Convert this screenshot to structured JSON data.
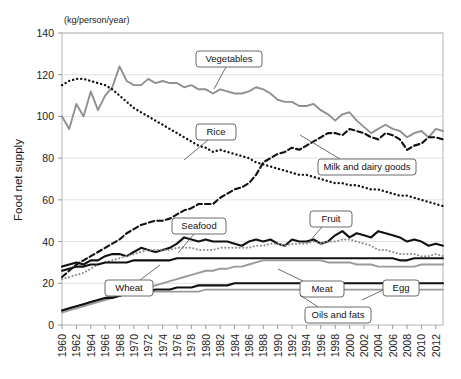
{
  "chart_data": {
    "type": "line",
    "title": "",
    "subtitle": "",
    "unit_label": "(kg/person/year)",
    "ylabel": "Food net supply",
    "xlabel": "",
    "ylim": [
      0,
      140
    ],
    "ytick_values": [
      0,
      20,
      40,
      60,
      80,
      100,
      120,
      140
    ],
    "ytick_labels": [
      "0",
      "20",
      "40",
      "60",
      "80",
      "100",
      "120",
      "140"
    ],
    "grid": true,
    "legend_position": "annotations-inline",
    "xlim": [
      1960,
      2013
    ],
    "x": [
      1960,
      1961,
      1962,
      1963,
      1964,
      1965,
      1966,
      1967,
      1968,
      1969,
      1970,
      1971,
      1972,
      1973,
      1974,
      1975,
      1976,
      1977,
      1978,
      1979,
      1980,
      1981,
      1982,
      1983,
      1984,
      1985,
      1986,
      1987,
      1988,
      1989,
      1990,
      1991,
      1992,
      1993,
      1994,
      1995,
      1996,
      1997,
      1998,
      1999,
      2000,
      2001,
      2002,
      2003,
      2004,
      2005,
      2006,
      2007,
      2008,
      2009,
      2010,
      2011,
      2012,
      2013
    ],
    "xtick_labels": [
      "1960",
      "1962",
      "1964",
      "1966",
      "1968",
      "1970",
      "1972",
      "1974",
      "1976",
      "1978",
      "1980",
      "1982",
      "1984",
      "1986",
      "1988",
      "1990",
      "1992",
      "1994",
      "1996",
      "1998",
      "2000",
      "2002",
      "2004",
      "2006",
      "2008",
      "2010",
      "2012"
    ],
    "series": [
      {
        "name": "Vegetables",
        "color": "#909090",
        "style": "solid",
        "width": 1.9,
        "values": [
          100,
          94,
          106,
          100,
          112,
          103,
          110,
          114,
          124,
          117,
          115,
          115,
          118,
          116,
          117,
          116,
          116,
          114,
          115,
          113,
          113,
          111,
          113,
          112,
          111,
          111,
          112,
          114,
          113,
          111,
          108,
          107,
          107,
          105,
          105,
          106,
          103,
          101,
          98,
          101,
          102,
          98,
          95,
          92,
          94,
          96,
          94,
          93,
          90,
          92,
          93,
          90,
          94,
          93
        ]
      },
      {
        "name": "Rice",
        "color": "#111111",
        "style": "dotted",
        "width": 2.3,
        "values": [
          115,
          117,
          118,
          118,
          117,
          116,
          115,
          113,
          110,
          107,
          104,
          102,
          100,
          98,
          96,
          94,
          92,
          90,
          88,
          86,
          85,
          83,
          84,
          83,
          82,
          81,
          80,
          78,
          77,
          76,
          75,
          74,
          73,
          72,
          72,
          71,
          70,
          69,
          68,
          68,
          67,
          67,
          66,
          65,
          65,
          64,
          63,
          62,
          62,
          61,
          60,
          59,
          58,
          57
        ]
      },
      {
        "name": "Milk and dairy goods",
        "color": "#111111",
        "style": "dashed",
        "width": 2.1,
        "values": [
          23,
          26,
          29,
          31,
          33,
          35,
          37,
          39,
          41,
          44,
          46,
          48,
          49,
          50,
          50,
          51,
          53,
          55,
          56,
          58,
          58,
          58,
          61,
          63,
          65,
          66,
          68,
          72,
          78,
          80,
          82,
          83,
          85,
          84,
          86,
          88,
          90,
          92,
          92,
          91,
          94,
          93,
          92,
          90,
          89,
          92,
          91,
          89,
          84,
          86,
          87,
          90,
          90,
          89
        ]
      },
      {
        "name": "Seafood",
        "color": "#111111",
        "style": "solid",
        "width": 2.1,
        "values": [
          28,
          29,
          30,
          29,
          31,
          31,
          33,
          34,
          34,
          33,
          35,
          37,
          36,
          35,
          36,
          37,
          39,
          42,
          41,
          40,
          41,
          40,
          40,
          40,
          39,
          38,
          40,
          41,
          40,
          41,
          39,
          38,
          41,
          40,
          40,
          41,
          39,
          40,
          43,
          45,
          42,
          44,
          43,
          42,
          45,
          44,
          43,
          42,
          40,
          41,
          40,
          38,
          39,
          38
        ]
      },
      {
        "name": "Fruit",
        "color": "#8d8d8d",
        "style": "dotted",
        "width": 2.0,
        "values": [
          22,
          23,
          24,
          25,
          27,
          29,
          30,
          31,
          32,
          33,
          34,
          35,
          36,
          36,
          36,
          36,
          37,
          37,
          37,
          36,
          36,
          36,
          37,
          37,
          37,
          37,
          37,
          38,
          38,
          39,
          39,
          38,
          39,
          39,
          39,
          40,
          39,
          40,
          40,
          41,
          41,
          40,
          39,
          38,
          36,
          36,
          35,
          34,
          34,
          34,
          33,
          33,
          34,
          33
        ]
      },
      {
        "name": "Wheat",
        "color": "#111111",
        "style": "solid",
        "width": 2.1,
        "values": [
          26,
          27,
          28,
          28,
          29,
          29,
          30,
          30,
          30,
          30,
          31,
          31,
          31,
          31,
          31,
          31,
          32,
          32,
          32,
          32,
          32,
          32,
          32,
          32,
          32,
          32,
          32,
          32,
          32,
          32,
          32,
          32,
          32,
          32,
          32,
          32,
          32,
          32,
          32,
          32,
          32,
          32,
          32,
          32,
          32,
          32,
          32,
          31,
          31,
          32,
          32,
          32,
          32,
          32
        ]
      },
      {
        "name": "Meat",
        "color": "#9a9a9a",
        "style": "solid",
        "width": 1.9,
        "values": [
          6,
          7,
          8,
          9,
          10,
          11,
          12,
          13,
          14,
          15,
          16,
          17,
          18,
          19,
          20,
          21,
          22,
          23,
          24,
          25,
          26,
          26,
          27,
          27,
          28,
          28,
          29,
          30,
          31,
          31,
          31,
          31,
          31,
          31,
          31,
          31,
          31,
          30,
          30,
          30,
          30,
          29,
          29,
          29,
          28,
          28,
          28,
          28,
          28,
          28,
          29,
          29,
          29,
          29
        ]
      },
      {
        "name": "Egg",
        "color": "#9a9a9a",
        "style": "solid",
        "width": 1.7,
        "values": [
          7,
          8,
          9,
          10,
          11,
          12,
          13,
          14,
          14,
          15,
          15,
          16,
          16,
          16,
          16,
          16,
          16,
          16,
          16,
          16,
          17,
          17,
          17,
          17,
          17,
          17,
          17,
          17,
          17,
          17,
          17,
          17,
          17,
          17,
          17,
          17,
          17,
          17,
          17,
          17,
          17,
          17,
          17,
          17,
          17,
          17,
          17,
          17,
          17,
          17,
          17,
          17,
          17,
          17
        ]
      },
      {
        "name": "Oils and fats",
        "color": "#111111",
        "style": "solid",
        "width": 2.1,
        "values": [
          7,
          8,
          9,
          10,
          11,
          12,
          13,
          13,
          14,
          15,
          15,
          16,
          16,
          17,
          17,
          17,
          18,
          18,
          18,
          19,
          19,
          19,
          19,
          19,
          20,
          20,
          20,
          20,
          20,
          20,
          20,
          20,
          20,
          20,
          20,
          20,
          20,
          20,
          20,
          20,
          20,
          20,
          20,
          20,
          20,
          20,
          20,
          20,
          20,
          20,
          20,
          20,
          20,
          20
        ]
      }
    ],
    "annotations": [
      {
        "label": "Vegetables",
        "box_x": 196,
        "box_y": 51,
        "box_w": 66,
        "box_h": 16,
        "tip_x": 226,
        "tip_y": 67,
        "leader_to_x": 214,
        "leader_to_y": 89
      },
      {
        "label": "Rice",
        "box_x": 196,
        "box_y": 124,
        "box_w": 40,
        "box_h": 16,
        "tip_x": 208,
        "tip_y": 140,
        "leader_to_x": 184,
        "leader_to_y": 160
      },
      {
        "label": "Milk and dairy goods",
        "box_x": 318,
        "box_y": 159,
        "box_w": 98,
        "box_h": 16,
        "tip_x": 340,
        "tip_y": 159,
        "leader_to_x": 300,
        "leader_to_y": 135
      },
      {
        "label": "Seafood",
        "box_x": 172,
        "box_y": 218,
        "box_w": 54,
        "box_h": 16,
        "tip_x": 194,
        "tip_y": 234,
        "leader_to_x": 178,
        "leader_to_y": 253
      },
      {
        "label": "Fruit",
        "box_x": 310,
        "box_y": 211,
        "box_w": 42,
        "box_h": 16,
        "tip_x": 322,
        "tip_y": 227,
        "leader_to_x": 308,
        "leader_to_y": 243
      },
      {
        "label": "Wheat",
        "box_x": 105,
        "box_y": 280,
        "box_w": 48,
        "box_h": 16,
        "tip_x": 140,
        "tip_y": 280,
        "leader_to_x": 160,
        "leader_to_y": 265
      },
      {
        "label": "Meat",
        "box_x": 300,
        "box_y": 281,
        "box_w": 44,
        "box_h": 16,
        "tip_x": 303,
        "tip_y": 281,
        "leader_to_x": 278,
        "leader_to_y": 269
      },
      {
        "label": "Egg",
        "box_x": 383,
        "box_y": 280,
        "box_w": 36,
        "box_h": 16,
        "tip_x": 383,
        "tip_y": 290,
        "leader_to_x": 362,
        "leader_to_y": 300
      },
      {
        "label": "Oils and fats",
        "box_x": 305,
        "box_y": 307,
        "box_w": 66,
        "box_h": 16,
        "tip_x": 318,
        "tip_y": 307,
        "leader_to_x": 300,
        "leader_to_y": 295
      }
    ]
  }
}
